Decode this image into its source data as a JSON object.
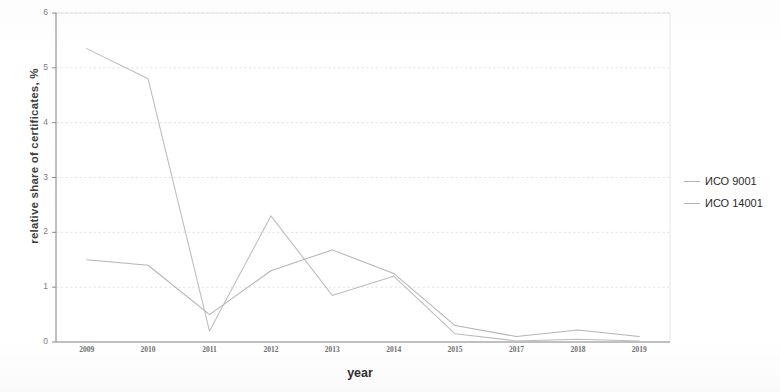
{
  "chart_data": {
    "type": "line",
    "title": "",
    "xlabel": "year",
    "ylabel": "relative share of certificates, %",
    "categories": [
      "2009",
      "2010",
      "2011",
      "2012",
      "2013",
      "2014",
      "2015",
      "2017",
      "2018",
      "2019"
    ],
    "ylim": [
      0,
      6
    ],
    "yticks": [
      0,
      1,
      2,
      3,
      4,
      5,
      6
    ],
    "grid": true,
    "legend_position": "right",
    "series": [
      {
        "name": "ИСО 9001",
        "color": "#b0b0b0",
        "values": [
          1.5,
          1.4,
          0.5,
          1.3,
          1.68,
          1.25,
          0.3,
          0.1,
          0.22,
          0.1
        ]
      },
      {
        "name": "ИСО 14001",
        "color": "#b8b8b8",
        "values": [
          5.35,
          4.8,
          0.2,
          2.3,
          0.85,
          1.2,
          0.15,
          0.02,
          0.05,
          0.02
        ]
      }
    ]
  },
  "axis": {
    "ytick_labels": [
      "6",
      "5",
      "4",
      "3",
      "2",
      "1",
      "0"
    ],
    "xtick_labels": [
      "2009",
      "2010",
      "2011",
      "2012",
      "2013",
      "2014",
      "2015",
      "2017",
      "2018",
      "2019"
    ],
    "xlabel": "year",
    "ylabel": "relative share of certificates, %"
  },
  "legend": {
    "items": [
      {
        "label": "ИСО 9001"
      },
      {
        "label": "ИСО 14001"
      }
    ]
  },
  "cut_title": {
    "text": ""
  }
}
